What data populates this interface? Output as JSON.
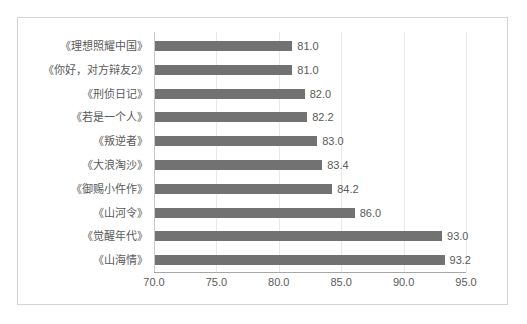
{
  "chart_data": {
    "type": "bar",
    "orientation": "horizontal",
    "title": "",
    "subtitle": "",
    "xlabel": "",
    "ylabel": "",
    "xlim": [
      70.0,
      95.0
    ],
    "xticks": [
      "70.0",
      "75.0",
      "80.0",
      "85.0",
      "90.0",
      "95.0"
    ],
    "xtick_values": [
      70.0,
      75.0,
      80.0,
      85.0,
      90.0,
      95.0
    ],
    "grid": true,
    "legend": false,
    "legend_position": "none",
    "bar_color": "#727272",
    "categories": [
      "《理想照耀中国》",
      "《你好，对方辩友2》",
      "《刑侦日记》",
      "《若是一个人》",
      "《叛逆者》",
      "《大浪淘沙》",
      "《御赐小仵作》",
      "《山河令》",
      "《觉醒年代》",
      "《山海情》"
    ],
    "values": [
      81.0,
      81.0,
      82.0,
      82.2,
      83.0,
      83.4,
      84.2,
      86.0,
      93.0,
      93.2
    ],
    "data_labels": [
      "81.0",
      "81.0",
      "82.0",
      "82.2",
      "83.0",
      "83.4",
      "84.2",
      "86.0",
      "93.0",
      "93.2"
    ]
  }
}
